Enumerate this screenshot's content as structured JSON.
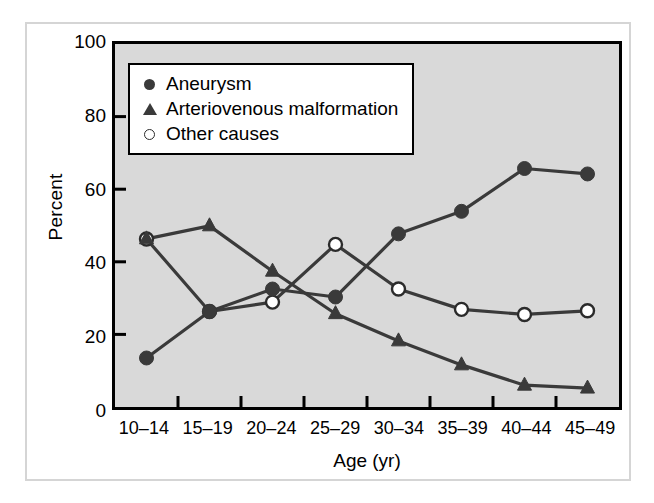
{
  "figure": {
    "panel_background": "#d9d9d9",
    "outer_frame_color": "#d5d5d5",
    "axis_color": "#000000",
    "series_color": "#3a3a3a"
  },
  "chart_data": {
    "type": "line",
    "title": "",
    "xlabel": "Age (yr)",
    "ylabel": "Percent",
    "ylim": [
      0,
      100
    ],
    "yticks": [
      0,
      20,
      40,
      60,
      80,
      100
    ],
    "ytick_labels": [
      "0",
      "20",
      "40",
      "60",
      "80",
      "100"
    ],
    "grid": false,
    "legend_position": "top-left",
    "categories": [
      "10–14",
      "15–19",
      "20–24",
      "25–29",
      "30–34",
      "35–39",
      "40–44",
      "45–49"
    ],
    "series": [
      {
        "name": "Aneurysm",
        "marker": "filled-circle",
        "color": "#3a3a3a",
        "values": [
          13.5,
          26.3,
          32.5,
          30.3,
          47.7,
          53.9,
          65.7,
          64.2
        ]
      },
      {
        "name": "Arteriovenous malformation",
        "marker": "filled-triangle",
        "color": "#3a3a3a",
        "values": [
          46.3,
          49.9,
          37.4,
          25.7,
          18.2,
          11.6,
          6.0,
          5.2
        ]
      },
      {
        "name": "Other causes",
        "marker": "open-circle",
        "color": "#3a3a3a",
        "values": [
          46.3,
          26.3,
          28.9,
          44.8,
          32.5,
          26.9,
          25.5,
          26.5
        ]
      }
    ]
  },
  "legend": {
    "items": [
      {
        "label": "Aneurysm",
        "marker": "filled-circle"
      },
      {
        "label": "Arteriovenous malformation",
        "marker": "filled-triangle"
      },
      {
        "label": "Other causes",
        "marker": "open-circle"
      }
    ]
  }
}
